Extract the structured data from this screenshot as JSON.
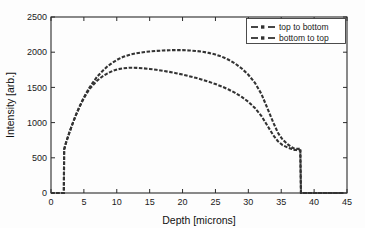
{
  "chart_data": {
    "type": "line",
    "title": "",
    "xlabel": "Depth [microns]",
    "ylabel": "Intensity [arb.]",
    "xlim": [
      0,
      45
    ],
    "ylim": [
      0,
      2500
    ],
    "xticks": [
      0,
      5,
      10,
      15,
      20,
      25,
      30,
      35,
      40,
      45
    ],
    "yticks": [
      0,
      500,
      1000,
      1500,
      2000,
      2500
    ],
    "grid": false,
    "legend_position": "top-right",
    "line_color": "#333333",
    "series": [
      {
        "name": "top to bottom",
        "color": "#333333",
        "style": "dashed-with-markers",
        "x": [
          0.0,
          1.0,
          1.95,
          2.0,
          2.3,
          2.8,
          3.3,
          3.8,
          4.3,
          4.8,
          5.3,
          5.8,
          6.3,
          7.0,
          7.8,
          8.6,
          9.4,
          10.2,
          11.0,
          12.0,
          13.0,
          14.0,
          15.0,
          16.0,
          17.0,
          18.0,
          19.0,
          20.0,
          21.0,
          22.0,
          23.0,
          24.0,
          25.0,
          26.0,
          27.0,
          28.0,
          29.0,
          30.0,
          31.0,
          32.0,
          33.0,
          33.8,
          34.5,
          35.2,
          36.0,
          36.6,
          37.0,
          37.3,
          37.6,
          37.9,
          38.0,
          39.0,
          41.0,
          43.0,
          44.5
        ],
        "y": [
          0,
          0,
          0,
          620,
          720,
          860,
          990,
          1110,
          1220,
          1320,
          1410,
          1490,
          1560,
          1650,
          1730,
          1800,
          1855,
          1900,
          1935,
          1965,
          1985,
          2000,
          2010,
          2018,
          2024,
          2028,
          2030,
          2029,
          2025,
          2018,
          2007,
          1990,
          1967,
          1935,
          1893,
          1838,
          1768,
          1680,
          1565,
          1405,
          1180,
          1000,
          855,
          760,
          690,
          650,
          630,
          628,
          627,
          626,
          0,
          0,
          0,
          0,
          0
        ]
      },
      {
        "name": "bottom to top",
        "color": "#333333",
        "style": "dashed-with-markers",
        "x": [
          0.0,
          1.0,
          1.95,
          2.0,
          2.3,
          2.8,
          3.3,
          3.8,
          4.3,
          4.8,
          5.3,
          5.8,
          6.3,
          7.0,
          7.8,
          8.6,
          9.4,
          10.2,
          11.0,
          12.0,
          13.0,
          14.0,
          15.0,
          16.0,
          17.0,
          18.0,
          19.0,
          20.0,
          21.0,
          22.0,
          23.0,
          24.0,
          25.0,
          26.0,
          27.0,
          28.0,
          29.0,
          30.0,
          31.0,
          32.0,
          33.0,
          33.8,
          34.5,
          35.2,
          36.0,
          36.6,
          37.0,
          37.3,
          37.6,
          37.9,
          38.0,
          39.0,
          41.0,
          43.0,
          44.5
        ],
        "y": [
          0,
          0,
          0,
          620,
          720,
          860,
          990,
          1110,
          1215,
          1310,
          1395,
          1470,
          1525,
          1595,
          1655,
          1700,
          1735,
          1758,
          1772,
          1780,
          1778,
          1772,
          1762,
          1750,
          1736,
          1720,
          1702,
          1682,
          1660,
          1636,
          1610,
          1580,
          1548,
          1512,
          1470,
          1422,
          1365,
          1296,
          1208,
          1093,
          940,
          820,
          735,
          680,
          645,
          625,
          612,
          610,
          609,
          608,
          0,
          0,
          0,
          0,
          0
        ]
      }
    ]
  },
  "legend": {
    "entries": [
      {
        "label": "top to bottom"
      },
      {
        "label": "bottom to top"
      }
    ]
  },
  "axes": {
    "x": {
      "title": "Depth [microns]",
      "ticks": [
        "0",
        "5",
        "10",
        "15",
        "20",
        "25",
        "30",
        "35",
        "40",
        "45"
      ]
    },
    "y": {
      "title": "Intensity [arb.]",
      "ticks": [
        "0",
        "500",
        "1000",
        "1500",
        "2000",
        "2500"
      ]
    }
  }
}
